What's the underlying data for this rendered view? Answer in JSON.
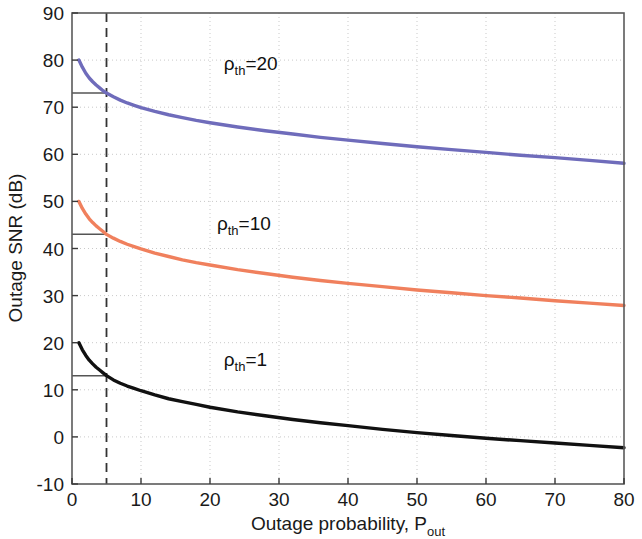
{
  "chart_data": {
    "type": "line",
    "title": "",
    "xlabel": "Outage probability, P",
    "xlabel_sub": "out",
    "ylabel": "Outage SNR (dB)",
    "xlim": [
      0,
      80
    ],
    "ylim": [
      -10,
      90
    ],
    "xticks": [
      0,
      10,
      20,
      30,
      40,
      50,
      60,
      70,
      80
    ],
    "xticklabels": [
      "0",
      "10",
      "20",
      "30",
      "40",
      "50",
      "60",
      "70",
      "80"
    ],
    "yticks": [
      -10,
      0,
      10,
      20,
      30,
      40,
      50,
      60,
      70,
      80,
      90
    ],
    "yticklabels": [
      "-10",
      "0",
      "10",
      "20",
      "30",
      "40",
      "50",
      "60",
      "70",
      "80",
      "90"
    ],
    "grid": true,
    "grid_style": "dotted",
    "legend": "none",
    "annotations": [
      {
        "name": "rho-th-20-label",
        "text": "=20",
        "symbol": "ρ",
        "subscript": "th",
        "x": 22,
        "y": 78
      },
      {
        "name": "rho-th-10-label",
        "text": "=10",
        "symbol": "ρ",
        "subscript": "th",
        "x": 21,
        "y": 44
      },
      {
        "name": "rho-th-1-label",
        "text": "=1",
        "symbol": "ρ",
        "subscript": "th",
        "x": 22,
        "y": 15
      }
    ],
    "reference_lines": {
      "vertical": {
        "x": 5,
        "style": "dashed",
        "color": "#333333"
      },
      "horizontal": [
        {
          "y": 73,
          "x_from": 0,
          "x_to": 5,
          "color": "#555555"
        },
        {
          "y": 43,
          "x_from": 0,
          "x_to": 5,
          "color": "#555555"
        },
        {
          "y": 13,
          "x_from": 0,
          "x_to": 5,
          "color": "#555555"
        }
      ]
    },
    "series": [
      {
        "name": "rho_th=20",
        "color": "#6f6cbb",
        "x": [
          1,
          1.5,
          2,
          2.5,
          3,
          3.5,
          4,
          4.5,
          5,
          6,
          7,
          8,
          9,
          10,
          12,
          14,
          16,
          18,
          20,
          24,
          28,
          32,
          36,
          40,
          45,
          50,
          55,
          60,
          65,
          70,
          75,
          80
        ],
        "y": [
          80.0,
          78.5,
          77.2,
          76.2,
          75.4,
          74.7,
          74.1,
          73.5,
          73.0,
          72.2,
          71.5,
          70.9,
          70.4,
          69.9,
          69.1,
          68.4,
          67.8,
          67.2,
          66.7,
          65.8,
          65.0,
          64.3,
          63.6,
          63.0,
          62.3,
          61.6,
          61.0,
          60.4,
          59.8,
          59.3,
          58.7,
          58.1
        ]
      },
      {
        "name": "rho_th=10",
        "color": "#f0805d",
        "x": [
          1,
          1.5,
          2,
          2.5,
          3,
          3.5,
          4,
          4.5,
          5,
          6,
          7,
          8,
          9,
          10,
          12,
          14,
          16,
          18,
          20,
          24,
          28,
          32,
          36,
          40,
          45,
          50,
          55,
          60,
          65,
          70,
          75,
          80
        ],
        "y": [
          50.0,
          48.5,
          47.3,
          46.3,
          45.5,
          44.8,
          44.2,
          43.6,
          43.0,
          42.2,
          41.5,
          40.9,
          40.4,
          39.9,
          39.0,
          38.3,
          37.6,
          37.0,
          36.5,
          35.5,
          34.7,
          33.9,
          33.2,
          32.6,
          31.9,
          31.2,
          30.6,
          30.0,
          29.5,
          28.9,
          28.4,
          27.9
        ]
      },
      {
        "name": "rho_th=1",
        "color": "#111111",
        "x": [
          1,
          1.5,
          2,
          2.5,
          3,
          3.5,
          4,
          4.5,
          5,
          6,
          7,
          8,
          9,
          10,
          12,
          14,
          16,
          18,
          20,
          24,
          28,
          32,
          36,
          40,
          45,
          50,
          55,
          60,
          65,
          70,
          75,
          80
        ],
        "y": [
          20.0,
          18.5,
          17.3,
          16.3,
          15.5,
          14.8,
          14.2,
          13.6,
          13.0,
          12.1,
          11.4,
          10.8,
          10.3,
          9.8,
          8.9,
          8.1,
          7.5,
          6.9,
          6.3,
          5.3,
          4.5,
          3.7,
          3.0,
          2.4,
          1.6,
          0.9,
          0.3,
          -0.3,
          -0.8,
          -1.3,
          -1.8,
          -2.3
        ]
      }
    ]
  }
}
